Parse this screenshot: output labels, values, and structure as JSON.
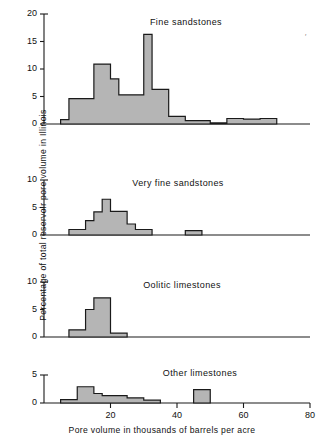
{
  "figure": {
    "ylabel": "Percentage of total reservoir pore volume in Illinois",
    "xlabel": "Pore volume in thousands of barrels per acre",
    "x_ticks": [
      20,
      40,
      60,
      80
    ],
    "x_range": [
      0,
      80
    ],
    "fill_color": "#a8a8a8",
    "line_color": "#1a1a1a",
    "background": "#ffffff",
    "stray_mark": "′"
  },
  "panels": [
    {
      "title": "Fine sandstones",
      "y_ticks": [
        0,
        5,
        10,
        15,
        20
      ],
      "ylim": [
        0,
        20
      ]
    },
    {
      "title": "Very fine sandstones",
      "y_ticks": [
        0,
        5,
        10
      ],
      "ylim": [
        0,
        10
      ]
    },
    {
      "title": "Oolitic limestones",
      "y_ticks": [
        0,
        5,
        10
      ],
      "ylim": [
        0,
        10
      ]
    },
    {
      "title": "Other limestones",
      "y_ticks": [
        0,
        5
      ],
      "ylim": [
        0,
        5
      ]
    }
  ],
  "chart_data": [
    {
      "type": "bar",
      "title": "Fine sandstones",
      "xlabel": "Pore volume in thousands of barrels per acre",
      "ylabel": "Percentage of total reservoir pore volume in Illinois",
      "xlim": [
        0,
        80
      ],
      "ylim": [
        0,
        20
      ],
      "grid": false,
      "legend": "none",
      "bin_edges": [
        5.0,
        7.5,
        15.0,
        20.0,
        22.5,
        30.0,
        32.5,
        37.5,
        42.5,
        50.0,
        55.0,
        60.0,
        65.0,
        70.0
      ],
      "bins": [
        {
          "x0": 5.0,
          "x1": 7.5,
          "value": 0.8
        },
        {
          "x0": 7.5,
          "x1": 15.0,
          "value": 4.6
        },
        {
          "x0": 15.0,
          "x1": 20.0,
          "value": 10.9
        },
        {
          "x0": 20.0,
          "x1": 22.5,
          "value": 8.2
        },
        {
          "x0": 22.5,
          "x1": 30.0,
          "value": 5.3
        },
        {
          "x0": 30.0,
          "x1": 32.5,
          "value": 16.3
        },
        {
          "x0": 32.5,
          "x1": 37.5,
          "value": 6.3
        },
        {
          "x0": 37.5,
          "x1": 42.5,
          "value": 1.4
        },
        {
          "x0": 42.5,
          "x1": 50.0,
          "value": 0.6
        },
        {
          "x0": 50.0,
          "x1": 55.0,
          "value": 0.2
        },
        {
          "x0": 55.0,
          "x1": 60.0,
          "value": 1.0
        },
        {
          "x0": 60.0,
          "x1": 65.0,
          "value": 0.9
        },
        {
          "x0": 65.0,
          "x1": 70.0,
          "value": 1.0
        }
      ]
    },
    {
      "type": "bar",
      "title": "Very fine sandstones",
      "xlabel": "Pore volume in thousands of barrels per acre",
      "ylabel": "Percentage of total reservoir pore volume in Illinois",
      "xlim": [
        0,
        80
      ],
      "ylim": [
        0,
        10
      ],
      "grid": false,
      "legend": "none",
      "bin_edges": [
        7.5,
        12.5,
        15.0,
        17.5,
        20.0,
        22.5,
        25.0,
        30.0,
        42.5,
        45.0
      ],
      "bins": [
        {
          "x0": 7.5,
          "x1": 12.5,
          "value": 1.0
        },
        {
          "x0": 12.5,
          "x1": 15.0,
          "value": 2.6
        },
        {
          "x0": 15.0,
          "x1": 17.5,
          "value": 4.2
        },
        {
          "x0": 17.5,
          "x1": 20.0,
          "value": 6.5
        },
        {
          "x0": 20.0,
          "x1": 22.5,
          "value": 4.3
        },
        {
          "x0": 22.5,
          "x1": 25.0,
          "value": 4.3
        },
        {
          "x0": 25.0,
          "x1": 27.5,
          "value": 2.0
        },
        {
          "x0": 27.5,
          "x1": 32.5,
          "value": 1.0
        },
        {
          "x0": 42.5,
          "x1": 47.5,
          "value": 0.8
        }
      ]
    },
    {
      "type": "bar",
      "title": "Oolitic limestones",
      "xlabel": "Pore volume in thousands of barrels per acre",
      "ylabel": "Percentage of total reservoir pore volume in Illinois",
      "xlim": [
        0,
        80
      ],
      "ylim": [
        0,
        10
      ],
      "grid": false,
      "legend": "none",
      "bin_edges": [
        7.5,
        12.5,
        15.0,
        20.0,
        25.0
      ],
      "bins": [
        {
          "x0": 7.5,
          "x1": 12.5,
          "value": 1.3
        },
        {
          "x0": 12.5,
          "x1": 15.0,
          "value": 5.0
        },
        {
          "x0": 15.0,
          "x1": 20.0,
          "value": 7.1
        },
        {
          "x0": 20.0,
          "x1": 25.0,
          "value": 0.7
        }
      ]
    },
    {
      "type": "bar",
      "title": "Other limestones",
      "xlabel": "Pore volume in thousands of barrels per acre",
      "ylabel": "Percentage of total reservoir pore volume in Illinois",
      "xlim": [
        0,
        80
      ],
      "ylim": [
        0,
        5
      ],
      "grid": false,
      "legend": "none",
      "bin_edges": [
        5.0,
        10.0,
        15.0,
        17.5,
        22.5,
        25.0,
        30.0,
        35.0,
        45.0,
        50.0
      ],
      "bins": [
        {
          "x0": 5.0,
          "x1": 10.0,
          "value": 0.6
        },
        {
          "x0": 10.0,
          "x1": 15.0,
          "value": 2.9
        },
        {
          "x0": 15.0,
          "x1": 17.5,
          "value": 1.7
        },
        {
          "x0": 17.5,
          "x1": 22.5,
          "value": 1.3
        },
        {
          "x0": 22.5,
          "x1": 25.0,
          "value": 1.3
        },
        {
          "x0": 25.0,
          "x1": 30.0,
          "value": 0.9
        },
        {
          "x0": 30.0,
          "x1": 35.0,
          "value": 0.5
        },
        {
          "x0": 45.0,
          "x1": 50.0,
          "value": 2.4
        }
      ]
    }
  ]
}
